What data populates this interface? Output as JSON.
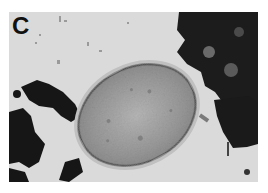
{
  "figure": {
    "panel_label": "C",
    "colors": {
      "background": "#d9d9d9",
      "cell_fill": "#9c9c9c",
      "cell_wall": "#5a5a5a",
      "debris": "#1a1a1a"
    }
  }
}
